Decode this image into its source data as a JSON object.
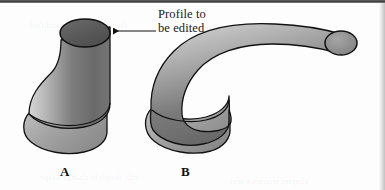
{
  "figure": {
    "background_color": "#fdfdfd",
    "ink_color": "#111111",
    "width": 385,
    "height": 190
  },
  "callout": {
    "line1": "Profile to",
    "line2": "be edited",
    "arrow_icon": "left-arrow-icon",
    "arrow_direction": "left",
    "points_to": "top-profile-ellipse-of-shape-a"
  },
  "labels": {
    "a": "A",
    "b": "B"
  },
  "shapes": {
    "a": {
      "name": "extruded-solid-before",
      "description": "Vertical swept solid with circular profile on top and flared elliptical base",
      "profile_fill": "#5f5f5f",
      "body_fill_light": "#cfcfcf",
      "body_fill_dark": "#6d6d6d",
      "base_fill": "#9a9a9a",
      "outline": "#111111"
    },
    "b": {
      "name": "extruded-solid-after",
      "description": "Same base swept along a curved path bending right and up, ending in a small circular cap",
      "tube_fill_light": "#c9c9c9",
      "tube_fill_dark": "#666666",
      "cap_fill": "#8f8f8f",
      "base_fill": "#9a9a9a",
      "outline": "#111111"
    }
  },
  "ghost_text": [
    "the profile can be modified",
    "after the feature is created",
    "edit sketch to change shape",
    "chapter reference text"
  ]
}
